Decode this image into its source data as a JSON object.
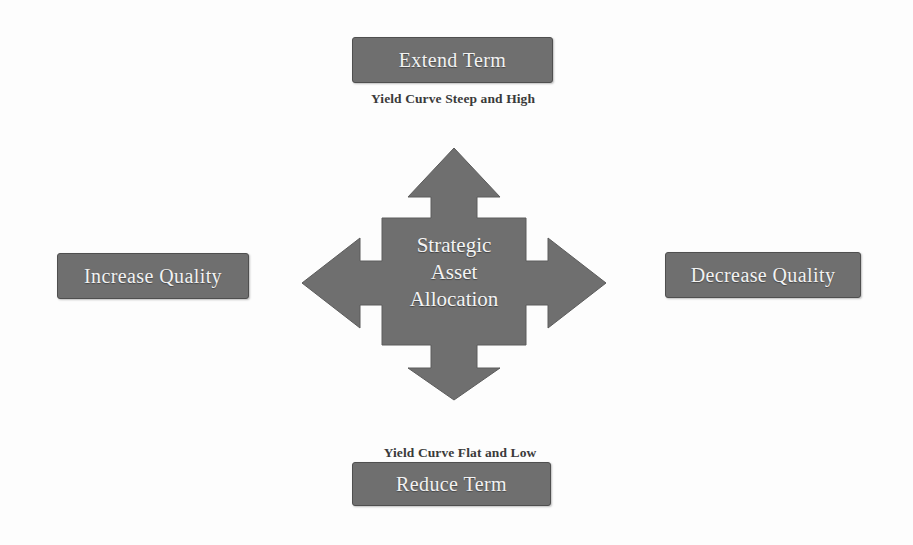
{
  "diagram": {
    "type": "four-way-arrow-diagram",
    "title": "Strategic Asset Allocation",
    "background_color": "#fdfdfd",
    "shape_fill": "#6f6f6f",
    "shape_stroke": "#5c5c5c",
    "box_fill": "#6f6f6f",
    "box_border": "#4f4f4f",
    "box_text_color": "#f2f2f2",
    "caption_text_color": "#3a3a3a"
  },
  "center": {
    "icon": "four-way-arrow-icon",
    "line1": "Strategic",
    "line2": "Asset",
    "line3": "Allocation"
  },
  "nodes": {
    "top": {
      "direction": "up",
      "label": "Extend Term",
      "caption": "Yield Curve Steep and High"
    },
    "bottom": {
      "direction": "down",
      "label": "Reduce Term",
      "caption": "Yield Curve Flat and Low"
    },
    "left": {
      "direction": "left",
      "label": "Increase Quality",
      "caption": ""
    },
    "right": {
      "direction": "right",
      "label": "Decrease Quality",
      "caption": ""
    }
  }
}
